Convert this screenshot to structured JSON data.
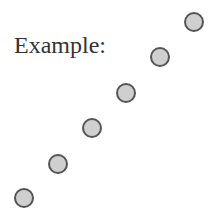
{
  "label": "Example:",
  "colors": {
    "text": "#333333",
    "dot_fill": "#cfcfcf",
    "dot_border": "#555555",
    "background": "#ffffff"
  },
  "dots": [
    {
      "cx": 194,
      "cy": 22
    },
    {
      "cx": 160,
      "cy": 57
    },
    {
      "cx": 126,
      "cy": 93
    },
    {
      "cx": 92,
      "cy": 128
    },
    {
      "cx": 58,
      "cy": 164
    },
    {
      "cx": 24,
      "cy": 198
    }
  ]
}
